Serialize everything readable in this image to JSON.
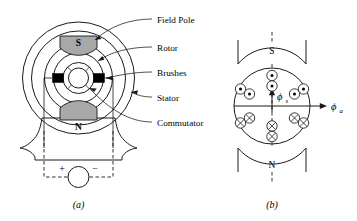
{
  "figure": {
    "panels": [
      {
        "id": "a",
        "caption": "(a)"
      },
      {
        "id": "b",
        "caption": "(b)"
      }
    ]
  },
  "panel_a": {
    "caption": "(a)",
    "pole_top_label": "S",
    "pole_bottom_label": "N",
    "source_plus": "+",
    "source_minus": "−",
    "callouts": [
      {
        "key": "field_pole",
        "label": "Field Pole"
      },
      {
        "key": "rotor",
        "label": "Rotor"
      },
      {
        "key": "brushes",
        "label": "Brushes"
      },
      {
        "key": "stator",
        "label": "Stator"
      },
      {
        "key": "commutator",
        "label": "Commutator"
      }
    ]
  },
  "panel_b": {
    "caption": "(b)",
    "pole_top_label": "S",
    "pole_bottom_label": "N",
    "flux_stator": {
      "symbol": "ϕ",
      "subscript": "s",
      "direction": "up"
    },
    "flux_armature": {
      "symbol": "ϕ",
      "subscript": "a",
      "direction": "right"
    },
    "conductor_groups": [
      {
        "key": "top-center",
        "marker": "dot",
        "count": 2
      },
      {
        "key": "upper-left",
        "marker": "dot",
        "count": 2
      },
      {
        "key": "upper-right",
        "marker": "dot",
        "count": 2
      },
      {
        "key": "lower-left",
        "marker": "cross",
        "count": 2
      },
      {
        "key": "lower-right",
        "marker": "cross",
        "count": 2
      },
      {
        "key": "bottom-center",
        "marker": "cross",
        "count": 2
      }
    ]
  },
  "colors": {
    "line": "#1a1a1a",
    "pole_fill": "#a8a8a8",
    "brush_fill": "#000000",
    "background": "#ffffff"
  }
}
